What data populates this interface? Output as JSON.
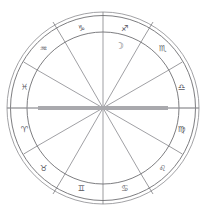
{
  "chart": {
    "type": "zodiac-wheel",
    "background_color": "#ffffff",
    "line_color": "#707074",
    "glyph_color": "#5a5a5f",
    "axis_color": "#a9a9ad",
    "center": {
      "x": 103,
      "y": 108
    },
    "radii": {
      "outermost": 96,
      "outer": 92,
      "inner_ring": 76,
      "inner_wheel": 76
    },
    "rings": {
      "count": 3,
      "description": "three concentric circles forming the zodiac band"
    },
    "house_count": 12,
    "sign_count": 12,
    "zodiac_signs": [
      {
        "name": "Sagittarius",
        "glyph": "♐",
        "label": "sagittarius",
        "angle_deg": -75
      },
      {
        "name": "Scorpio",
        "glyph": "♏",
        "label": "scorpio",
        "angle_deg": -45
      },
      {
        "name": "Libra",
        "glyph": "♎",
        "label": "libra",
        "angle_deg": -15
      },
      {
        "name": "Virgo",
        "glyph": "♍",
        "label": "virgo",
        "angle_deg": 15
      },
      {
        "name": "Leo",
        "glyph": "♌",
        "label": "leo",
        "angle_deg": 45
      },
      {
        "name": "Cancer",
        "glyph": "♋",
        "label": "cancer",
        "angle_deg": 75
      },
      {
        "name": "Gemini",
        "glyph": "♊",
        "label": "gemini",
        "angle_deg": 105
      },
      {
        "name": "Taurus",
        "glyph": "♉",
        "label": "taurus",
        "angle_deg": 135
      },
      {
        "name": "Aries",
        "glyph": "♈",
        "label": "aries",
        "angle_deg": 165
      },
      {
        "name": "Pisces",
        "glyph": "♓",
        "label": "pisces",
        "angle_deg": 195
      },
      {
        "name": "Aquarius",
        "glyph": "♒",
        "label": "aquarius",
        "angle_deg": 225
      },
      {
        "name": "Capricorn",
        "glyph": "♑",
        "label": "capricorn",
        "angle_deg": 255
      }
    ],
    "planets": [
      {
        "name": "Moon",
        "glyph": "☽",
        "label": "moon",
        "angle_deg": -68,
        "radius": 62
      }
    ],
    "axes": [
      {
        "name": "Ascendant-Descendant",
        "label": "horizontal-axis",
        "orientation": "horizontal"
      },
      {
        "name": "Midheaven",
        "label": "vertical-axis-top",
        "orientation": "vertical-top"
      }
    ]
  }
}
